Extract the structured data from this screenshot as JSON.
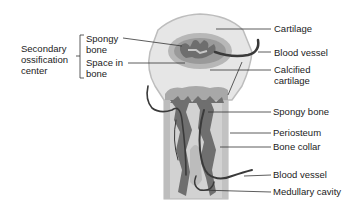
{
  "diagram": {
    "left_group": {
      "title_lines": [
        "Secondary",
        "ossification",
        "center"
      ],
      "items": [
        {
          "lines": [
            "Spongy",
            "bone"
          ]
        },
        {
          "lines": [
            "Space in",
            "bone"
          ]
        }
      ]
    },
    "right_labels": [
      {
        "id": "cartilage",
        "lines": [
          "Cartilage"
        ]
      },
      {
        "id": "blood-vessel-top",
        "lines": [
          "Blood vessel"
        ]
      },
      {
        "id": "calcified-cartilage",
        "lines": [
          "Calcified",
          "cartilage"
        ]
      },
      {
        "id": "spongy-bone",
        "lines": [
          "Spongy bone"
        ]
      },
      {
        "id": "periosteum",
        "lines": [
          "Periosteum"
        ]
      },
      {
        "id": "bone-collar",
        "lines": [
          "Bone collar"
        ]
      },
      {
        "id": "blood-vessel-bottom",
        "lines": [
          "Blood vessel"
        ]
      },
      {
        "id": "medullary-cavity",
        "lines": [
          "Medullary cavity"
        ]
      }
    ],
    "colors": {
      "cartilage": "#e4e4e4",
      "cartilage_edge": "#bdbdbd",
      "calcified": "#a9a9a9",
      "spongy_dark": "#6f6f6f",
      "shaft": "#cfcfcf",
      "vessel": "#3a3a3a",
      "leader": "#333333",
      "text": "#222222"
    }
  }
}
